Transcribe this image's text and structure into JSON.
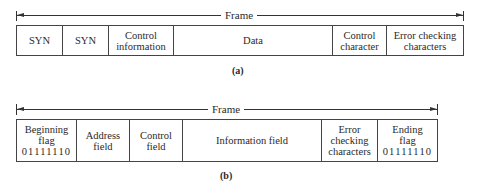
{
  "diagram_a": {
    "frame_label": "Frame",
    "caption": "(a)",
    "fields": [
      {
        "lines": [
          "SYN"
        ],
        "width": 46
      },
      {
        "lines": [
          "SYN"
        ],
        "width": 46
      },
      {
        "lines": [
          "Control",
          "information"
        ],
        "width": 65
      },
      {
        "lines": [
          "Data"
        ],
        "width": 159
      },
      {
        "lines": [
          "Control",
          "character"
        ],
        "width": 54
      },
      {
        "lines": [
          "Error checking",
          "characters"
        ],
        "width": 78
      }
    ]
  },
  "diagram_b": {
    "frame_label": "Frame",
    "caption": "(b)",
    "fields": [
      {
        "lines": [
          "Beginning",
          "flag",
          "01111110"
        ],
        "width": 60
      },
      {
        "lines": [
          "Address",
          "field"
        ],
        "width": 53
      },
      {
        "lines": [
          "Control",
          "field"
        ],
        "width": 53
      },
      {
        "lines": [
          "Information field"
        ],
        "width": 139
      },
      {
        "lines": [
          "Error",
          "checking",
          "characters"
        ],
        "width": 56
      },
      {
        "lines": [
          "Ending",
          "flag",
          "01111110"
        ],
        "width": 60
      }
    ]
  }
}
